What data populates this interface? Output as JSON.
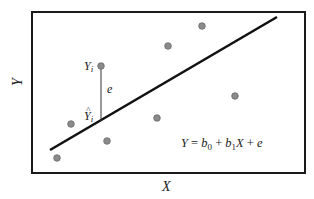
{
  "diagram": {
    "axis_labels": {
      "x": "X",
      "y": "Y"
    },
    "equation": {
      "Y": "Y",
      "equals": " = ",
      "b0_base": "b",
      "b0_sub": "0",
      "plus1": " + ",
      "b1_base": "b",
      "b1_sub": "1",
      "X": "X",
      "plus2": " + ",
      "e": "e"
    },
    "observed_label": {
      "base": "Y",
      "sub": "i"
    },
    "fitted_label": {
      "hat": "^",
      "base": "Y",
      "sub": "i"
    },
    "residual_label": "e",
    "colors": {
      "frame": "#1a1a1a",
      "line": "#111111",
      "point_fill": "#8a8a8a",
      "point_stroke": "#6a6a6a",
      "residual": "#333333",
      "text": "#222222"
    },
    "frame": {
      "x": 32,
      "y": 12,
      "width": 273,
      "height": 161
    },
    "regression_line": {
      "x1": 50,
      "y1": 150,
      "x2": 277,
      "y2": 17
    },
    "points": [
      {
        "x": 57,
        "y": 158
      },
      {
        "x": 71,
        "y": 124
      },
      {
        "x": 101,
        "y": 66,
        "highlighted": true
      },
      {
        "x": 107,
        "y": 141
      },
      {
        "x": 157,
        "y": 118
      },
      {
        "x": 168,
        "y": 46
      },
      {
        "x": 202,
        "y": 26
      },
      {
        "x": 235,
        "y": 96
      }
    ],
    "residual_segment": {
      "x": 101,
      "y1": 66,
      "y2": 131
    }
  }
}
